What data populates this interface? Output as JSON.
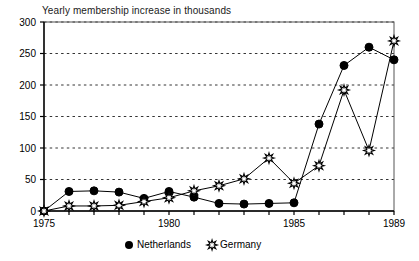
{
  "chart_data": {
    "type": "line",
    "title": "Yearly membership increase in thousands",
    "xlabel": "",
    "ylabel": "",
    "xlim": [
      1975,
      1989
    ],
    "ylim": [
      0,
      300
    ],
    "ytick_labels": [
      "0",
      "50",
      "100",
      "150",
      "200",
      "250",
      "300"
    ],
    "yticks": [
      0,
      50,
      100,
      150,
      200,
      250,
      300
    ],
    "xtick_labels": [
      "1975",
      "1980",
      "1985",
      "1989"
    ],
    "xticks": [
      1975,
      1980,
      1985,
      1989
    ],
    "x": [
      1975,
      1976,
      1977,
      1978,
      1979,
      1980,
      1981,
      1982,
      1983,
      1984,
      1985,
      1986,
      1987,
      1988,
      1989
    ],
    "grid": "horizontal-dashed",
    "legend_position": "bottom-center",
    "series": [
      {
        "name": "Netherlands",
        "marker": "filled-circle",
        "color": "#000000",
        "values": [
          0,
          31,
          32,
          30,
          20,
          31,
          22,
          12,
          11,
          12,
          13,
          138,
          231,
          260,
          240
        ]
      },
      {
        "name": "Germany",
        "marker": "open-star",
        "color": "#000000",
        "values": [
          0,
          8,
          8,
          9,
          15,
          21,
          32,
          40,
          51,
          84,
          44,
          72,
          192,
          96,
          270
        ]
      }
    ]
  }
}
